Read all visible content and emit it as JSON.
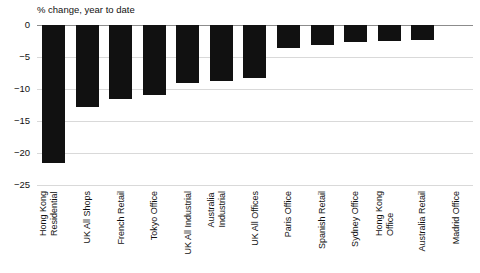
{
  "chart_data": {
    "type": "bar",
    "title": "% change, year to date",
    "xlabel": "",
    "ylabel": "",
    "ylim": [
      -25,
      0
    ],
    "yticks": [
      0,
      -5,
      -10,
      -15,
      -20,
      -25
    ],
    "ytick_labels": [
      "0",
      "−5",
      "−10",
      "−15",
      "−20",
      "−25"
    ],
    "grid": true,
    "legend": "none",
    "orientation": "vertical",
    "bar_color": "#111111",
    "categories": [
      "Hong Kong Residential",
      "UK All Shops",
      "French Retail",
      "Tokyo Office",
      "UK All Industrial",
      "Australia Industrial",
      "UK All Offices",
      "Paris Office",
      "Spanish Retail",
      "Sydney Office",
      "Hong Kong Office",
      "Australia Retail",
      "Madrid Office"
    ],
    "category_lines": [
      [
        "Hong Kong",
        "Residential"
      ],
      [
        "UK All Shops"
      ],
      [
        "French Retail"
      ],
      [
        "Tokyo Office"
      ],
      [
        "UK All Industrial"
      ],
      [
        "Australia",
        "Industrial"
      ],
      [
        "UK All Offices"
      ],
      [
        "Paris Office"
      ],
      [
        "Spanish Retail"
      ],
      [
        "Sydney Office"
      ],
      [
        "Hong Kong",
        "Office"
      ],
      [
        "Australia Retail"
      ],
      [
        "Madrid Office"
      ]
    ],
    "values": [
      -21.5,
      -12.8,
      -11.5,
      -11.0,
      -9.0,
      -8.8,
      -8.3,
      -3.6,
      -3.1,
      -2.6,
      -2.5,
      -2.4,
      0.0
    ]
  },
  "colors": {
    "bar": "#111111",
    "grid": "#d9d9d9",
    "axis": "#8c8c8c",
    "text": "#111111",
    "background": "#ffffff"
  }
}
